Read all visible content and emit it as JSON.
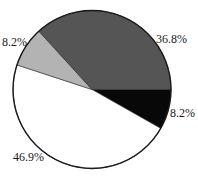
{
  "chart_data": {
    "type": "pie",
    "title": "",
    "start_angle_deg": 0,
    "direction": "clockwise",
    "slices": [
      {
        "label": "8.2%",
        "value": 8.2,
        "color": "#080808"
      },
      {
        "label": "46.9%",
        "value": 46.9,
        "color": "#ffffff"
      },
      {
        "label": "8.2%",
        "value": 8.2,
        "color": "#b3b3b3"
      },
      {
        "label": "36.8%",
        "value": 36.8,
        "color": "#555555"
      }
    ],
    "legend": null,
    "outline_color": "#1a1a1a"
  },
  "labels": {
    "black_slice": "8.2%",
    "white_slice": "46.9%",
    "light_gray_slice": "8.2%",
    "dark_gray_slice": "36.8%"
  }
}
